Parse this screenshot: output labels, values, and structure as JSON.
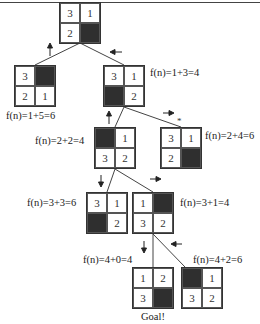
{
  "colors": {
    "blank_tile": "#2f2f2f",
    "line": "#444444",
    "tile_bg": "#ffffff"
  },
  "nodes": [
    {
      "id": "root",
      "tiles": [
        "3",
        "1",
        "2",
        ""
      ],
      "label": ""
    },
    {
      "id": "left-child",
      "tiles": [
        "3",
        "",
        "2",
        "1"
      ],
      "label": "f(n)=1+5=6"
    },
    {
      "id": "right-child",
      "tiles": [
        "3",
        "1",
        "",
        "2"
      ],
      "label": "f(n)=1+3=4"
    },
    {
      "id": "middle-node",
      "tiles": [
        "",
        "1",
        "3",
        "2"
      ],
      "label": "f(n)=2+2=4"
    },
    {
      "id": "starred-node",
      "tiles": [
        "3",
        "1",
        "2",
        ""
      ],
      "label": "f(n)=2+4=6",
      "mark": "*"
    },
    {
      "id": "row4-left",
      "tiles": [
        "3",
        "1",
        "",
        "2"
      ],
      "label": "f(n)=3+3=6"
    },
    {
      "id": "row4-right",
      "tiles": [
        "1",
        "",
        "3",
        "2"
      ],
      "label": "f(n)=3+1=4"
    },
    {
      "id": "goal-node",
      "tiles": [
        "1",
        "2",
        "3",
        ""
      ],
      "label": "f(n)=4+0=4",
      "caption": "Goal!"
    },
    {
      "id": "bottom-right",
      "tiles": [
        "",
        "1",
        "3",
        "2"
      ],
      "label": "f(n)=4+2=6"
    }
  ],
  "arrows": [
    "up",
    "left",
    "up",
    "right",
    "down",
    "right",
    "down",
    "left"
  ]
}
